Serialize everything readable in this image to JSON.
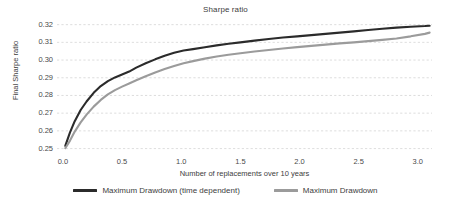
{
  "chart_data": {
    "type": "line",
    "title": "Sharpe ratio",
    "xlabel": "Number of replacements over 10 years",
    "ylabel": "Final Sharpe ratio",
    "xlim": [
      -0.05,
      3.12
    ],
    "ylim": [
      0.2475,
      0.3215
    ],
    "grid": true,
    "legend_position": "bottom",
    "xticks": [
      "0.0",
      "0.5",
      "1.0",
      "1.5",
      "2.0",
      "2.5",
      "3.0"
    ],
    "xtick_values": [
      0.0,
      0.5,
      1.0,
      1.5,
      2.0,
      2.5,
      3.0
    ],
    "yticks": [
      "0.25",
      "0.26",
      "0.27",
      "0.28",
      "0.29",
      "0.30",
      "0.31",
      "0.32"
    ],
    "ytick_values": [
      0.25,
      0.26,
      0.27,
      0.28,
      0.29,
      0.3,
      0.31,
      0.32
    ],
    "x": [
      0.02,
      0.06,
      0.1,
      0.15,
      0.2,
      0.26,
      0.32,
      0.38,
      0.44,
      0.5,
      0.56,
      0.62,
      0.7,
      0.78,
      0.86,
      0.94,
      1.02,
      1.1,
      1.2,
      1.3,
      1.4,
      1.5,
      1.62,
      1.74,
      1.86,
      1.98,
      2.1,
      2.22,
      2.34,
      2.46,
      2.58,
      2.7,
      2.82,
      2.94,
      3.06,
      3.1
    ],
    "series": [
      {
        "name": "Maximum Drawdown (time dependent)",
        "color": "#2b2b2b",
        "values": [
          0.2515,
          0.2592,
          0.2655,
          0.2718,
          0.2766,
          0.2815,
          0.2853,
          0.2881,
          0.2902,
          0.2918,
          0.2935,
          0.2957,
          0.2982,
          0.3004,
          0.3024,
          0.3041,
          0.3054,
          0.3062,
          0.3072,
          0.3083,
          0.3092,
          0.31,
          0.311,
          0.3119,
          0.3127,
          0.3134,
          0.3141,
          0.3148,
          0.3155,
          0.3162,
          0.317,
          0.3177,
          0.3183,
          0.3188,
          0.3192,
          0.3194
        ]
      },
      {
        "name": "Maximum Drawdown",
        "color": "#9b9b9b",
        "values": [
          0.2502,
          0.2545,
          0.2596,
          0.2648,
          0.2692,
          0.2737,
          0.2775,
          0.2806,
          0.283,
          0.285,
          0.2868,
          0.2886,
          0.2909,
          0.293,
          0.2949,
          0.2966,
          0.2982,
          0.2994,
          0.3008,
          0.302,
          0.303,
          0.3038,
          0.3048,
          0.3057,
          0.3065,
          0.3073,
          0.308,
          0.3087,
          0.3094,
          0.31,
          0.3107,
          0.3114,
          0.3122,
          0.3134,
          0.3148,
          0.3155
        ]
      }
    ]
  },
  "legend": {
    "entries": [
      {
        "label": "Maximum Drawdown (time dependent)",
        "color": "#2b2b2b"
      },
      {
        "label": "Maximum Drawdown",
        "color": "#9b9b9b"
      }
    ]
  }
}
